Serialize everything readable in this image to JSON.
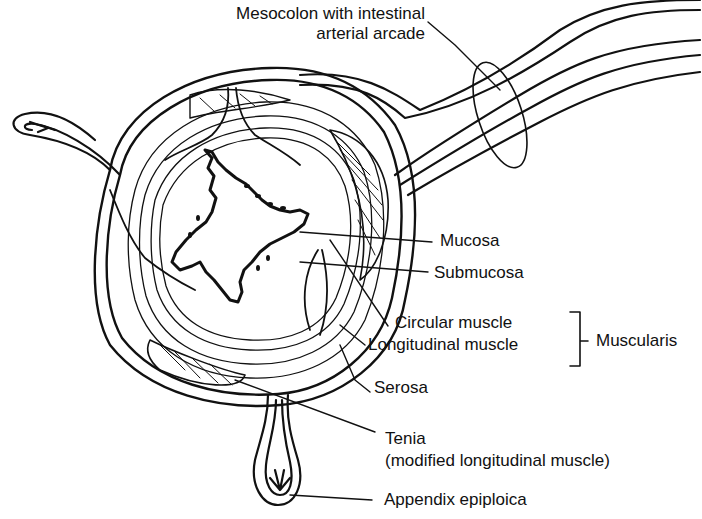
{
  "diagram": {
    "labels": {
      "mesocolon_line1": "Mesocolon with intestinal",
      "mesocolon_line2": "arterial arcade",
      "mucosa": "Mucosa",
      "submucosa": "Submucosa",
      "circular_muscle": "Circular muscle",
      "longitudinal_muscle": "Longitudinal muscle",
      "muscularis": "Muscularis",
      "serosa": "Serosa",
      "tenia_line1": "Tenia",
      "tenia_line2": "(modified longitudinal muscle)",
      "appendix_epiploica": "Appendix epiploica"
    }
  }
}
